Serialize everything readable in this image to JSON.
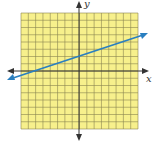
{
  "graph": {
    "x_label": "x",
    "y_label": "y",
    "grid_cells": 16,
    "colors": {
      "grid_bg": "#f7f08c",
      "grid_line": "#8a8550",
      "axis": "#333333",
      "line": "#2a7fc0"
    },
    "line": {
      "slope": 0.3333,
      "intercept": 2,
      "description": "y = x/3 + 2"
    }
  }
}
